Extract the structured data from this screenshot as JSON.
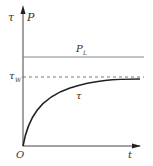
{
  "diagram": {
    "y_axis_label_tau": "τ",
    "y_axis_label_p": "P",
    "x_axis_label": "t",
    "origin_label": "O",
    "pl_line_label_main": "P",
    "pl_line_label_sub": "L",
    "tau_w_label_main": "τ",
    "tau_w_label_sub": "W",
    "curve_label": "τ"
  },
  "colors": {
    "axis": "#444444",
    "pl_line": "#888888",
    "dashed_line": "#555555",
    "curve": "#222222"
  }
}
